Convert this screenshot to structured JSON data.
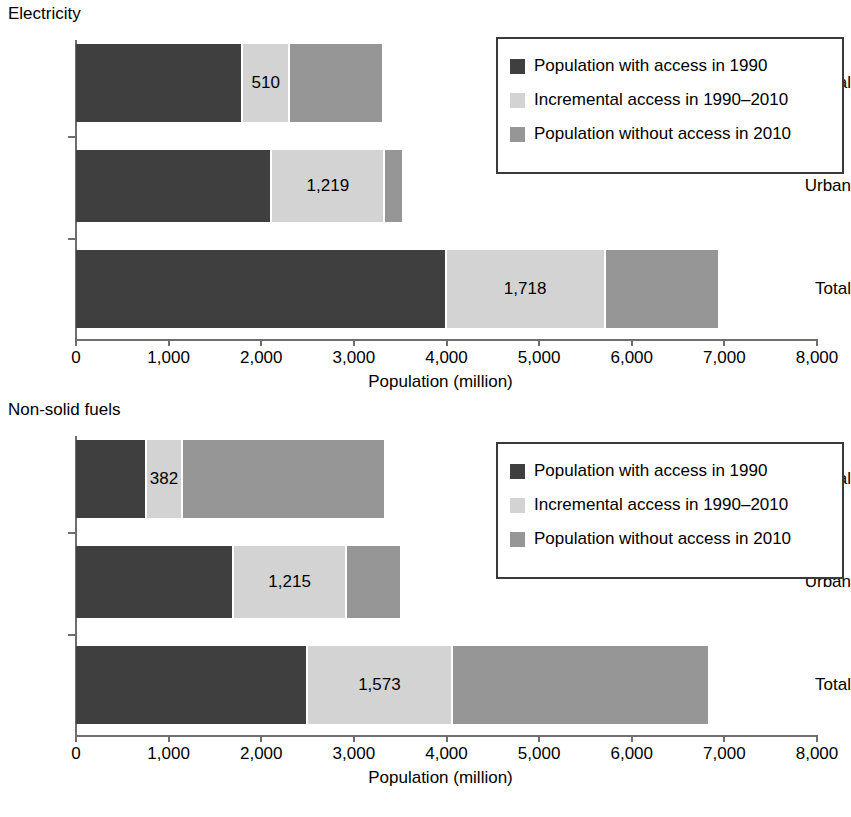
{
  "chart_data": [
    {
      "type": "bar",
      "title": "Electricity",
      "orientation": "horizontal",
      "stacked": true,
      "xlabel": "Population (million)",
      "ylabel": "",
      "xlim": [
        0,
        8000
      ],
      "xticks": [
        0,
        1000,
        2000,
        3000,
        4000,
        5000,
        6000,
        7000,
        8000
      ],
      "xticklabels": [
        "0",
        "1,000",
        "2,000",
        "3,000",
        "4,000",
        "5,000",
        "6,000",
        "7,000",
        "8,000"
      ],
      "grid": false,
      "legend_position": "top-right",
      "categories": [
        "Rural",
        "Urban",
        "Total"
      ],
      "series": [
        {
          "name": "Population with access in 1990",
          "color": "#3f3f3f",
          "values": [
            1805,
            2120,
            4000
          ]
        },
        {
          "name": "Incremental access in 1990–2010",
          "color": "#d3d3d3",
          "values": [
            510,
            1219,
            1718
          ]
        },
        {
          "name": "Population without access in 2010",
          "color": "#969696",
          "values": [
            1015,
            205,
            1230
          ]
        }
      ],
      "data_labels": {
        "Rural": "510",
        "Urban": "1,219",
        "Total": "1,718"
      }
    },
    {
      "type": "bar",
      "title": "Non-solid fuels",
      "orientation": "horizontal",
      "stacked": true,
      "xlabel": "Population (million)",
      "ylabel": "",
      "xlim": [
        0,
        8000
      ],
      "xticks": [
        0,
        1000,
        2000,
        3000,
        4000,
        5000,
        6000,
        7000,
        8000
      ],
      "xticklabels": [
        "0",
        "1,000",
        "2,000",
        "3,000",
        "4,000",
        "5,000",
        "6,000",
        "7,000",
        "8,000"
      ],
      "grid": false,
      "legend_position": "top-right",
      "categories": [
        "Rural",
        "Urban",
        "Total"
      ],
      "series": [
        {
          "name": "Population with access in 1990",
          "color": "#3f3f3f",
          "values": [
            770,
            1710,
            2500
          ]
        },
        {
          "name": "Incremental access in 1990–2010",
          "color": "#d3d3d3",
          "values": [
            382,
            1215,
            1573
          ]
        },
        {
          "name": "Population without access in 2010",
          "color": "#969696",
          "values": [
            2195,
            595,
            2770
          ]
        }
      ],
      "data_labels": {
        "Rural": "382",
        "Urban": "1,215",
        "Total": "1,573"
      }
    }
  ],
  "panels": [
    {
      "title": "Electricity",
      "axis_title": "Population (million)",
      "ticks": [
        {
          "value": 0,
          "label": "0"
        },
        {
          "value": 1000,
          "label": "1,000"
        },
        {
          "value": 2000,
          "label": "2,000"
        },
        {
          "value": 3000,
          "label": "3,000"
        },
        {
          "value": 4000,
          "label": "4,000"
        },
        {
          "value": 5000,
          "label": "5,000"
        },
        {
          "value": 6000,
          "label": "6,000"
        },
        {
          "value": 7000,
          "label": "7,000"
        },
        {
          "value": 8000,
          "label": "8,000"
        }
      ],
      "rows": [
        {
          "label": "Rural",
          "segments": [
            {
              "series": "Population with access in 1990",
              "value": 1805,
              "color": "#3f3f3f",
              "label": ""
            },
            {
              "series": "Incremental access in 1990–2010",
              "value": 510,
              "color": "#d3d3d3",
              "label": "510"
            },
            {
              "series": "Population without access in 2010",
              "value": 1015,
              "color": "#969696",
              "label": ""
            }
          ]
        },
        {
          "label": "Urban",
          "segments": [
            {
              "series": "Population with access in 1990",
              "value": 2120,
              "color": "#3f3f3f",
              "label": ""
            },
            {
              "series": "Incremental access in 1990–2010",
              "value": 1219,
              "color": "#d3d3d3",
              "label": "1,219"
            },
            {
              "series": "Population without access in 2010",
              "value": 205,
              "color": "#969696",
              "label": ""
            }
          ]
        },
        {
          "label": "Total",
          "segments": [
            {
              "series": "Population with access in 1990",
              "value": 4000,
              "color": "#3f3f3f",
              "label": ""
            },
            {
              "series": "Incremental access in 1990–2010",
              "value": 1718,
              "color": "#d3d3d3",
              "label": "1,718"
            },
            {
              "series": "Population without access in 2010",
              "value": 1230,
              "color": "#969696",
              "label": ""
            }
          ]
        }
      ],
      "legend": [
        {
          "label": "Population with access in 1990",
          "color": "#3f3f3f"
        },
        {
          "label": "Incremental access in 1990–2010",
          "color": "#d3d3d3"
        },
        {
          "label": "Population without access in 2010",
          "color": "#969696"
        }
      ]
    },
    {
      "title": "Non-solid fuels",
      "axis_title": "Population (million)",
      "ticks": [
        {
          "value": 0,
          "label": "0"
        },
        {
          "value": 1000,
          "label": "1,000"
        },
        {
          "value": 2000,
          "label": "2,000"
        },
        {
          "value": 3000,
          "label": "3,000"
        },
        {
          "value": 4000,
          "label": "4,000"
        },
        {
          "value": 5000,
          "label": "5,000"
        },
        {
          "value": 6000,
          "label": "6,000"
        },
        {
          "value": 7000,
          "label": "7,000"
        },
        {
          "value": 8000,
          "label": "8,000"
        }
      ],
      "rows": [
        {
          "label": "Rural",
          "segments": [
            {
              "series": "Population with access in 1990",
              "value": 770,
              "color": "#3f3f3f",
              "label": ""
            },
            {
              "series": "Incremental access in 1990–2010",
              "value": 382,
              "color": "#d3d3d3",
              "label": "382"
            },
            {
              "series": "Population without access in 2010",
              "value": 2195,
              "color": "#969696",
              "label": ""
            }
          ]
        },
        {
          "label": "Urban",
          "segments": [
            {
              "series": "Population with access in 1990",
              "value": 1710,
              "color": "#3f3f3f",
              "label": ""
            },
            {
              "series": "Incremental access in 1990–2010",
              "value": 1215,
              "color": "#d3d3d3",
              "label": "1,215"
            },
            {
              "series": "Population without access in 2010",
              "value": 595,
              "color": "#969696",
              "label": ""
            }
          ]
        },
        {
          "label": "Total",
          "segments": [
            {
              "series": "Population with access in 1990",
              "value": 2500,
              "color": "#3f3f3f",
              "label": ""
            },
            {
              "series": "Incremental access in 1990–2010",
              "value": 1573,
              "color": "#d3d3d3",
              "label": "1,573"
            },
            {
              "series": "Population without access in 2010",
              "value": 2770,
              "color": "#969696",
              "label": ""
            }
          ]
        }
      ],
      "legend": [
        {
          "label": "Population with access in 1990",
          "color": "#3f3f3f"
        },
        {
          "label": "Incremental access in 1990–2010",
          "color": "#d3d3d3"
        },
        {
          "label": "Population without access in 2010",
          "color": "#969696"
        }
      ]
    }
  ]
}
